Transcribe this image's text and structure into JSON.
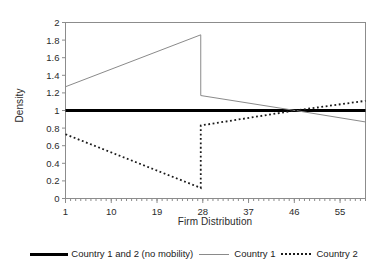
{
  "chart_data": {
    "type": "line",
    "title": "",
    "xlabel": "Firm Distribution",
    "ylabel": "Density",
    "xlim": [
      1,
      60
    ],
    "ylim": [
      0,
      2
    ],
    "grid": false,
    "legend_position": "bottom",
    "x_ticks": [
      "1",
      "10",
      "19",
      "28",
      "37",
      "46",
      "55"
    ],
    "x_tick_values": [
      1,
      10,
      19,
      28,
      37,
      46,
      55
    ],
    "x_minor_tick_step": 1,
    "y_ticks": [
      "0",
      "0.2",
      "0.4",
      "0.6",
      "0.8",
      "1",
      "1.2",
      "1.4",
      "1.6",
      "1.8",
      "2"
    ],
    "y_tick_values": [
      0,
      0.2,
      0.4,
      0.6,
      0.8,
      1,
      1.2,
      1.4,
      1.6,
      1.8,
      2
    ],
    "series": [
      {
        "name": "Country 1 and 2 (no mobility)",
        "style": "thick-solid",
        "color": "#000000",
        "points": [
          [
            1,
            1.0
          ],
          [
            60,
            1.0
          ]
        ]
      },
      {
        "name": "Country 1",
        "style": "thin-solid",
        "color": "#8a8a8a",
        "points": [
          [
            1,
            1.27
          ],
          [
            27.6,
            1.86
          ],
          [
            27.6,
            1.17
          ],
          [
            46.2,
            1.0
          ],
          [
            60,
            0.87
          ]
        ]
      },
      {
        "name": "Country 2",
        "style": "dotted",
        "color": "#1a1a1a",
        "points": [
          [
            1,
            0.73
          ],
          [
            27.6,
            0.12
          ],
          [
            27.6,
            0.83
          ],
          [
            46.2,
            1.0
          ],
          [
            60,
            1.11
          ]
        ]
      }
    ],
    "annotations": []
  },
  "legend": {
    "entries": [
      {
        "label": "Country 1 and 2 (no mobility)",
        "swatch": "thick-solid-line-swatch"
      },
      {
        "label": "Country 1",
        "swatch": "thin-solid-line-swatch"
      },
      {
        "label": "Country 2",
        "swatch": "dotted-line-swatch"
      }
    ]
  },
  "axes": {
    "x_title": "Firm Distribution",
    "y_title": "Density"
  },
  "colors": {
    "axis": "#8c8c8c",
    "text": "#2b2b2b",
    "series_no_mobility": "#000000",
    "series_country_1": "#8a8a8a",
    "series_country_2": "#1a1a1a",
    "background": "#ffffff"
  }
}
